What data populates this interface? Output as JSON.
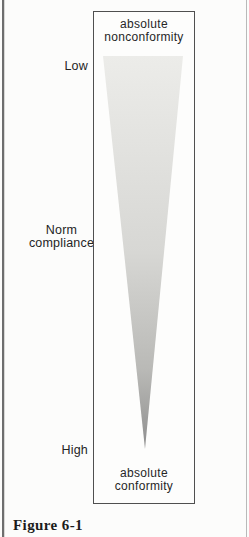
{
  "figure": {
    "caption": "Figure 6-1",
    "box_top_label": {
      "line1": "absolute",
      "line2": "nonconformity"
    },
    "box_bottom_label": {
      "line1": "absolute",
      "line2": "conformity"
    },
    "scale": {
      "low": "Low",
      "mid_line1": "Norm",
      "mid_line2": "compliance",
      "high": "High"
    },
    "wedge": {
      "shape": "inverted-triangle",
      "gradient": [
        "#ecece9",
        "#d7d7d4",
        "#b9b9b6",
        "#8e8e8e"
      ]
    },
    "colors": {
      "text": "#2b2b2b",
      "box_border": "#4f4f4f",
      "page_border_left": "#6e6e6e",
      "page_border_right": "#b9b9b9",
      "background": "#fcfcfb"
    }
  }
}
